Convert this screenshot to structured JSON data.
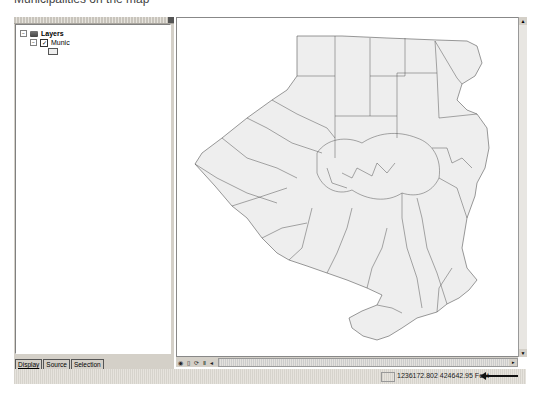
{
  "caption": "Municipalities on the map",
  "toc": {
    "root_label": "Layers",
    "layer_label": "Munic",
    "layer_checked": true,
    "tabs": [
      "Display",
      "Source",
      "Selection"
    ],
    "active_tab": "Display"
  },
  "map": {
    "layer": "Munic",
    "fill_color": "#eeeeee",
    "stroke_color": "#555555"
  },
  "map_toolbar": {
    "icons": [
      "data-view-icon",
      "layout-view-icon",
      "refresh-icon",
      "pause-icon"
    ]
  },
  "status": {
    "x": "1236172.802",
    "y": "424642.95",
    "units": "Feet",
    "coords_text": "1236172.802  424642.95 Feet"
  },
  "glyphs": {
    "minus": "−",
    "check": "✓",
    "up": "▲",
    "down": "▼",
    "left": "◂",
    "right": "▸",
    "close": "×"
  }
}
